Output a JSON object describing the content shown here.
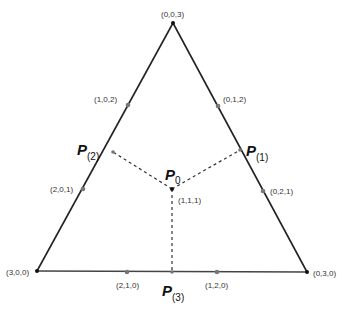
{
  "diagram": {
    "vertices": {
      "top": "(0,0,3)",
      "bottom_left": "(3,0,0)",
      "bottom_right": "(0,3,0)"
    },
    "edge_points": {
      "left_upper": "(1,0,2)",
      "left_lower": "(2,0,1)",
      "right_upper": "(0,1,2)",
      "right_lower": "(0,2,1)",
      "bottom_left": "(2,1,0)",
      "bottom_right": "(1,2,0)"
    },
    "center": {
      "label": "(1,1,1)",
      "name": "P",
      "sub": "0"
    },
    "projections": [
      {
        "name": "P",
        "sub": "(1)"
      },
      {
        "name": "P",
        "sub": "(2)"
      },
      {
        "name": "P",
        "sub": "(3)"
      }
    ],
    "colors": {
      "edge": "#222222",
      "dashed": "#333333",
      "marker": "#777777"
    }
  }
}
